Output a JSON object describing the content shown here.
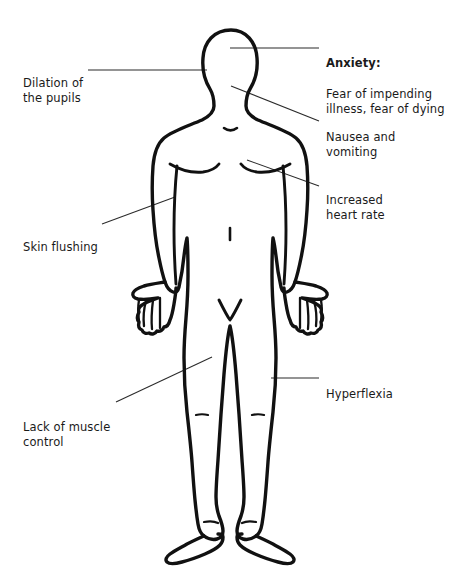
{
  "diagram": {
    "ink_color": "#111111",
    "text_color": "#1a1a1a",
    "background_color": "#ffffff"
  },
  "labels": [
    {
      "id": "dilation",
      "side": "left",
      "lead": "",
      "text": "Dilation of\nthe pupils",
      "target": "eyes"
    },
    {
      "id": "skin-flushing",
      "side": "left",
      "lead": "",
      "text": "Skin flushing",
      "target": "left-arm"
    },
    {
      "id": "lack-of-muscle-control",
      "side": "left",
      "lead": "",
      "text": "Lack of muscle\ncontrol",
      "target": "left-thigh"
    },
    {
      "id": "anxiety",
      "side": "right",
      "lead": "Anxiety:",
      "text": "Fear of impending\nillness, fear of dying",
      "target": "head"
    },
    {
      "id": "nausea-and-vomiting",
      "side": "right",
      "lead": "",
      "text": "Nausea and\nvomiting",
      "target": "jaw-neck"
    },
    {
      "id": "increased-heart-rate",
      "side": "right",
      "lead": "",
      "text": "Increased\nheart rate",
      "target": "chest"
    },
    {
      "id": "hyperflexia",
      "side": "right",
      "lead": "",
      "text": "Hyperflexia",
      "target": "right-thigh"
    }
  ]
}
